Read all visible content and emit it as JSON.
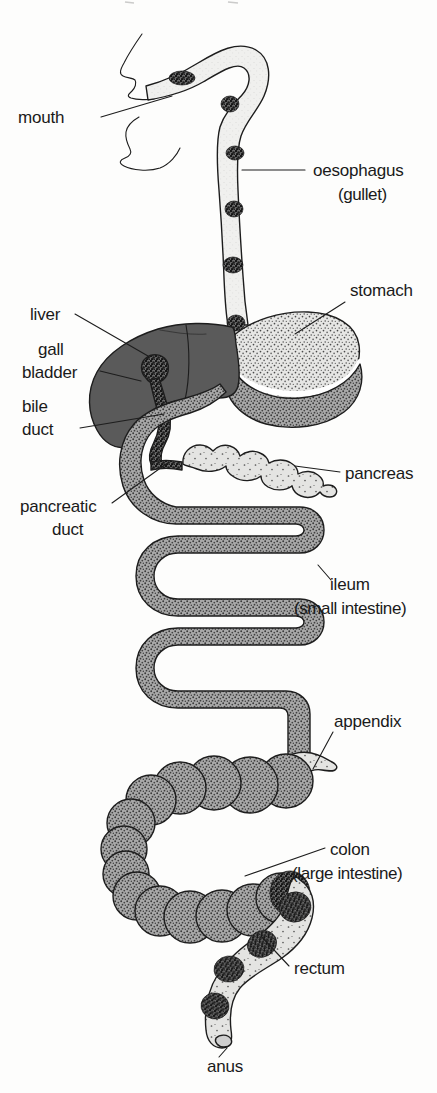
{
  "figure": {
    "type": "labelled-anatomical-diagram",
    "width": 437,
    "height": 1093,
    "background_color": "#fdfdfc",
    "ink_color": "#1d1d1d"
  },
  "palette": {
    "outline": "#1d1d1d",
    "liver_fill": "#5a5a5a",
    "stomach_upper_fill": "#d9d9d9",
    "stomach_lower_fill": "#8e8e8e",
    "pancreas_fill": "#e3e3e3",
    "ileum_fill": "#8a8a8a",
    "colon_fill": "#8a8a8a",
    "rectum_fill": "#e0e0e0",
    "oesophagus_fill": "#eeeeec",
    "appendix_fill": "#dcdcdc",
    "bolus_fill": "#2a2a2a",
    "duct_fill": "#555555"
  },
  "labels": [
    {
      "id": "mouth",
      "name": "mouth",
      "lines": [
        "mouth"
      ],
      "text_x": 18,
      "text_y": 123,
      "anchor": "start",
      "leader": "M 101,117 L 172,96"
    },
    {
      "id": "oesophagus",
      "name": "oesophagus",
      "lines": [
        "oesophagus",
        "(gullet)"
      ],
      "text_x": 313,
      "text_y": 176,
      "anchor": "start",
      "leader": "M 242,170 L 305,170"
    },
    {
      "id": "stomach",
      "name": "stomach",
      "lines": [
        "stomach"
      ],
      "text_x": 350,
      "text_y": 296,
      "anchor": "start",
      "leader": "M 295,334 L 345,302"
    },
    {
      "id": "liver",
      "name": "liver",
      "lines": [
        "liver"
      ],
      "text_x": 30,
      "text_y": 318,
      "anchor": "start",
      "leader": "M 75,314 L 148,356"
    },
    {
      "id": "gall-bladder",
      "name": "gall bladder",
      "lines": [
        "gall",
        "bladder"
      ],
      "text_x": 30,
      "text_y": 350,
      "anchor": "start",
      "leader": "M 100,371 L 139,382"
    },
    {
      "id": "bile-duct",
      "name": "bile duct",
      "lines": [
        "bile",
        "duct"
      ],
      "text_x": 22,
      "text_y": 408,
      "anchor": "start",
      "leader": "M 80,428 L 163,415"
    },
    {
      "id": "pancreas",
      "name": "pancreas",
      "lines": [
        "pancreas"
      ],
      "text_x": 345,
      "text_y": 478,
      "anchor": "start",
      "leader": "M 295,466 L 340,472"
    },
    {
      "id": "pancreatic-duct",
      "name": "pancreatic duct",
      "lines": [
        "pancreatic",
        "duct"
      ],
      "text_x": 22,
      "text_y": 512,
      "anchor": "start",
      "leader": "M 112,503 L 166,464"
    },
    {
      "id": "ileum",
      "name": "ileum",
      "lines": [
        "ileum",
        "(small intestine)"
      ],
      "text_x": 328,
      "text_y": 590,
      "anchor": "start",
      "leader": "M 318,566 L 330,580"
    },
    {
      "id": "appendix",
      "name": "appendix",
      "lines": [
        "appendix"
      ],
      "text_x": 334,
      "text_y": 727,
      "anchor": "start",
      "leader": "M 332,733 L 312,768"
    },
    {
      "id": "colon",
      "name": "colon",
      "lines": [
        "colon",
        "(large intestine)"
      ],
      "text_x": 330,
      "text_y": 845,
      "anchor": "start",
      "leader": "M 245,876 L 325,848"
    },
    {
      "id": "rectum",
      "name": "rectum",
      "lines": [
        "rectum"
      ],
      "text_x": 294,
      "text_y": 972,
      "anchor": "start",
      "leader": "M 278,966 L 258,941"
    },
    {
      "id": "anus",
      "name": "anus",
      "lines": [
        "anus"
      ],
      "text_x": 208,
      "text_y": 1070,
      "anchor": "start",
      "leader": "M 228,1046 L 219,1056"
    }
  ],
  "organs": [
    {
      "id": "head-profile",
      "name": "head profile with mouth"
    },
    {
      "id": "oesophagus",
      "name": "oesophagus (gullet)"
    },
    {
      "id": "stomach",
      "name": "stomach"
    },
    {
      "id": "liver",
      "name": "liver"
    },
    {
      "id": "gall-bladder",
      "name": "gall bladder"
    },
    {
      "id": "bile-duct",
      "name": "bile duct"
    },
    {
      "id": "pancreas",
      "name": "pancreas"
    },
    {
      "id": "pancreatic-duct",
      "name": "pancreatic duct"
    },
    {
      "id": "duodenum",
      "name": "duodenum"
    },
    {
      "id": "ileum",
      "name": "ileum (small intestine)"
    },
    {
      "id": "caecum",
      "name": "caecum"
    },
    {
      "id": "appendix",
      "name": "appendix"
    },
    {
      "id": "colon",
      "name": "colon (large intestine)"
    },
    {
      "id": "rectum",
      "name": "rectum"
    },
    {
      "id": "anus",
      "name": "anus"
    }
  ],
  "food_boluses": {
    "name": "food bolus marks in oesophagus",
    "count": 6
  },
  "faeces_marks": {
    "name": "faeces marks in rectum",
    "count": 4
  }
}
